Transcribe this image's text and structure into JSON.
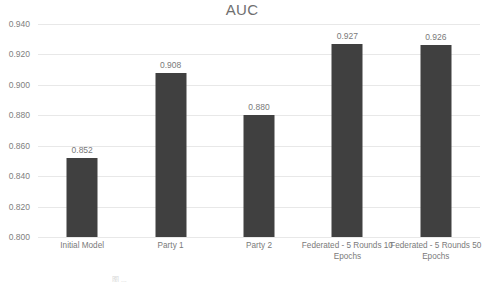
{
  "chart_data": {
    "type": "bar",
    "title": "AUC",
    "xlabel": "",
    "ylabel": "",
    "ylim": [
      0.8,
      0.94
    ],
    "ytick_step": 0.02,
    "ytick_labels": [
      "0.940",
      "0.920",
      "0.900",
      "0.880",
      "0.860",
      "0.840",
      "0.820",
      "0.800"
    ],
    "ytick_values": [
      0.94,
      0.92,
      0.9,
      0.88,
      0.86,
      0.84,
      0.82,
      0.8
    ],
    "grid": true,
    "legend": "none",
    "bar_color": "#404040",
    "gridline_color": "#e8e8e8",
    "text_color": "#7a7a7a",
    "categories": [
      "Initial Model",
      "Party 1",
      "Party 2",
      "Federated - 5 Rounds 10 Epochs",
      "Federated - 5 Rounds 50 Epochs"
    ],
    "category_lines": [
      [
        "Initial Model"
      ],
      [
        "Party 1"
      ],
      [
        "Party 2"
      ],
      [
        "Federated - 5 Rounds 10",
        "Epochs"
      ],
      [
        "Federated - 5 Rounds 50",
        "Epochs"
      ]
    ],
    "values": [
      0.852,
      0.908,
      0.88,
      0.927,
      0.926
    ],
    "data_labels": [
      "0.852",
      "0.908",
      "0.880",
      "0.927",
      "0.926"
    ]
  },
  "caption": {
    "cut_off_text": "图 ..."
  }
}
